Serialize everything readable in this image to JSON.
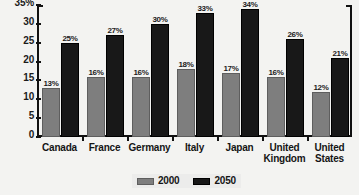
{
  "chart_data": {
    "type": "bar",
    "title": "",
    "xlabel": "",
    "ylabel": "",
    "ylim": [
      0,
      35
    ],
    "grid": false,
    "legend_position": "bottom",
    "ytick_labels": [
      "35%",
      "30",
      "25",
      "20",
      "15",
      "10",
      "5",
      "0"
    ],
    "ytick_values": [
      35,
      30,
      25,
      20,
      15,
      10,
      5,
      0
    ],
    "categories": [
      "Canada",
      "France",
      "Germany",
      "Italy",
      "Japan",
      "United Kingdom",
      "United States"
    ],
    "category_lines": [
      [
        "Canada"
      ],
      [
        "France"
      ],
      [
        "Germany"
      ],
      [
        "Italy"
      ],
      [
        "Japan"
      ],
      [
        "United",
        "Kingdom"
      ],
      [
        "United",
        "States"
      ]
    ],
    "series": [
      {
        "name": "2000",
        "color": "#7e7e7e",
        "values": [
          13,
          16,
          16,
          18,
          17,
          16,
          12
        ],
        "labels": [
          "13%",
          "16%",
          "16%",
          "18%",
          "17%",
          "16%",
          "12%"
        ]
      },
      {
        "name": "2050",
        "color": "#181818",
        "values": [
          25,
          27,
          30,
          33,
          34,
          26,
          21
        ],
        "labels": [
          "25%",
          "27%",
          "30%",
          "33%",
          "34%",
          "26%",
          "21%"
        ]
      }
    ]
  },
  "legend": {
    "items": [
      {
        "label": "2000"
      },
      {
        "label": "2050"
      }
    ]
  }
}
